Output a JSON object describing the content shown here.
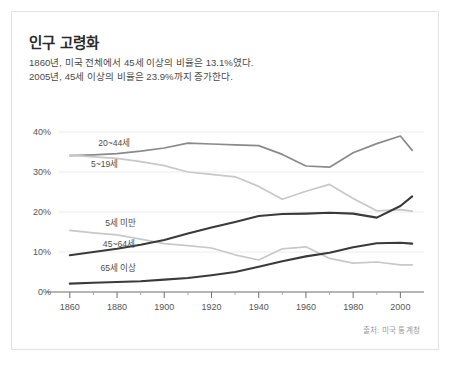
{
  "card": {
    "title": "인구 고령화",
    "subtitle": "1860년, 미국 전체에서 45세 이상의 비율은 13.1%였다.\n2005년, 45세 이상의 비율은 23.9%까지 증가한다.",
    "source": "출처: 미국 통계청"
  },
  "colors": {
    "line_dark": "#3a3a3a",
    "line_medium": "#8a8a8a",
    "line_light": "#c8c8c8",
    "grid": "#ececec",
    "axis": "#6e6e6e",
    "text": "#4a4a4a",
    "title": "#2a2a2a",
    "card_border": "#e2e2e2",
    "background": "#ffffff"
  },
  "chart_data": {
    "type": "line",
    "title": "인구 고령화",
    "xlabel": "",
    "ylabel": "",
    "xlim": [
      1855,
      2010
    ],
    "ylim": [
      0,
      42
    ],
    "grid": true,
    "legend": "inline-labels",
    "xticks": [
      1860,
      1880,
      1900,
      1920,
      1940,
      1960,
      1980,
      2000
    ],
    "xtick_labels": [
      "1860",
      "1880",
      "1900",
      "1920",
      "1940",
      "1960",
      "1980",
      "2000"
    ],
    "xminor_ticks": [
      1870,
      1890,
      1910,
      1930,
      1950,
      1970,
      1990
    ],
    "yticks": [
      0,
      10,
      20,
      30,
      40
    ],
    "ytick_labels": [
      "0%",
      "10%",
      "20%",
      "30%",
      "40%"
    ],
    "x": [
      1860,
      1870,
      1880,
      1890,
      1900,
      1910,
      1920,
      1930,
      1940,
      1950,
      1960,
      1970,
      1980,
      1990,
      2000,
      2005
    ],
    "series": [
      {
        "name": "20~44세",
        "label": "20~44세",
        "color": "#8a8a8a",
        "width": 1.7,
        "label_x": 1872,
        "label_y": 36.6,
        "values": [
          34.1,
          34.3,
          34.6,
          35.2,
          36.0,
          37.2,
          37.0,
          36.8,
          36.6,
          34.4,
          31.5,
          31.2,
          34.8,
          37.1,
          39.0,
          35.4
        ]
      },
      {
        "name": "5~19세",
        "label": "5~19세",
        "color": "#c8c8c8",
        "width": 1.7,
        "label_x": 1869,
        "label_y": 31.3,
        "values": [
          34.2,
          33.8,
          33.4,
          32.6,
          31.6,
          30.0,
          29.4,
          28.8,
          26.4,
          23.2,
          25.2,
          26.9,
          23.4,
          20.3,
          20.6,
          20.2
        ]
      },
      {
        "name": "5세 미만",
        "label": "5세 미만",
        "color": "#c8c8c8",
        "width": 1.7,
        "label_x": 1875,
        "label_y": 16.5,
        "values": [
          15.4,
          14.8,
          14.3,
          13.2,
          12.1,
          11.6,
          11.0,
          9.3,
          8.0,
          10.8,
          11.3,
          8.4,
          7.2,
          7.5,
          6.8,
          6.8
        ]
      },
      {
        "name": "45~64세",
        "label": "45~64세",
        "color": "#3a3a3a",
        "width": 2.1,
        "label_x": 1874,
        "label_y": 11.2,
        "values": [
          9.2,
          10.0,
          10.8,
          11.8,
          13.0,
          14.6,
          16.1,
          17.5,
          19.0,
          19.5,
          19.6,
          19.8,
          19.6,
          18.6,
          21.5,
          23.9
        ]
      },
      {
        "name": "65세 이상",
        "label": "65세 이상",
        "color": "#3a3a3a",
        "width": 2.1,
        "label_x": 1873,
        "label_y": 5.3,
        "values": [
          2.1,
          2.3,
          2.5,
          2.7,
          3.1,
          3.5,
          4.2,
          5.0,
          6.3,
          7.7,
          8.9,
          9.8,
          11.2,
          12.2,
          12.3,
          12.1
        ]
      }
    ],
    "annotations": [
      {
        "text": "출처: 미국 통계청",
        "position": "bottom-right"
      }
    ]
  }
}
